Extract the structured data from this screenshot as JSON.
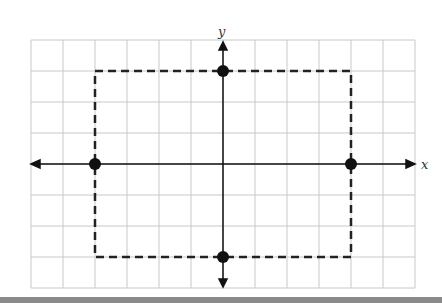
{
  "diagram": {
    "type": "coordinate-grid",
    "axis_labels": {
      "x": "x",
      "y": "y"
    },
    "grid": {
      "columns": 12,
      "rows": 8,
      "x_range": [
        -6,
        6
      ],
      "y_range": [
        -4,
        4
      ]
    },
    "points": [
      {
        "label": "top",
        "x": 0,
        "y": 3
      },
      {
        "label": "bottom",
        "x": 0,
        "y": -3
      },
      {
        "label": "left",
        "x": -4,
        "y": 0
      },
      {
        "label": "right",
        "x": 4,
        "y": 0
      }
    ],
    "dashed_rectangle": {
      "x_min": -4,
      "x_max": 4,
      "y_min": -3,
      "y_max": 3
    },
    "colors": {
      "grid": "#c8c8c8",
      "axis": "#111111",
      "points": "#111111",
      "bottom_bar": "#8a8a8a"
    }
  }
}
